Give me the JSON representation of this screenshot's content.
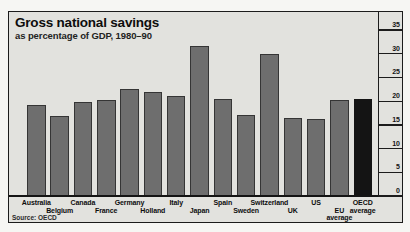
{
  "title": "Gross national savings",
  "subtitle": "as percentage of GDP, 1980–90",
  "source": "Source: OECD",
  "colors": {
    "page_bg": "#f6f6f3",
    "chart_bg": "#e2e2de",
    "bar": "#6e6e6e",
    "bar_border": "#353535",
    "highlight_bar": "#141414",
    "frame_line": "#1c1c1c",
    "text": "#0d0d0d"
  },
  "chart_data": {
    "type": "bar",
    "title": "Gross national savings",
    "subtitle": "as percentage of GDP, 1980–90",
    "xlabel": "",
    "ylabel": "% of GDP",
    "ylim": [
      0,
      35
    ],
    "yticks": [
      0,
      5,
      10,
      15,
      20,
      25,
      30,
      35
    ],
    "axis_side": "right",
    "grid": false,
    "legend": false,
    "categories": [
      "Australia",
      "Belgium",
      "Canada",
      "France",
      "Germany",
      "Holland",
      "Italy",
      "Japan",
      "Spain",
      "Sweden",
      "Switzerland",
      "UK",
      "US",
      "EU average",
      "OECD average"
    ],
    "values": [
      19.2,
      16.8,
      19.9,
      20.3,
      22.6,
      21.9,
      21.0,
      31.7,
      20.4,
      17.0,
      29.9,
      16.5,
      16.3,
      20.2,
      20.4
    ],
    "highlight_index": 14,
    "two_line_labels": {
      "13": [
        "EU",
        "average"
      ],
      "14": [
        "OECD",
        "average"
      ]
    },
    "label_row": [
      "upper",
      "lower",
      "upper",
      "lower",
      "upper",
      "lower",
      "upper",
      "lower",
      "upper",
      "lower",
      "upper",
      "lower",
      "upper",
      "lower",
      "upper"
    ],
    "source": "Source: OECD"
  }
}
